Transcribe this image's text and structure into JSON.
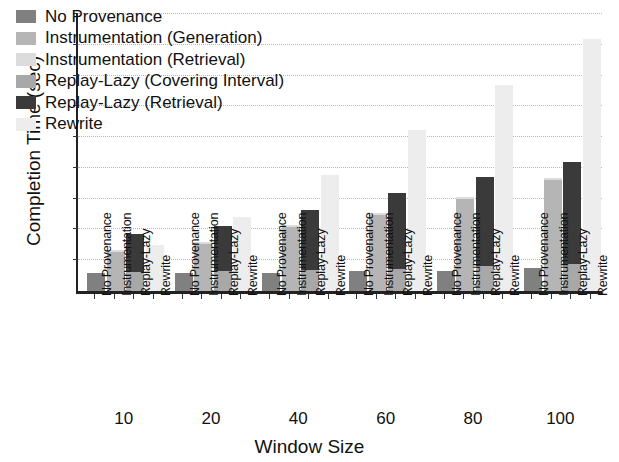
{
  "chart_data": {
    "type": "bar",
    "subtype": "grouped-stacked",
    "title": "",
    "xlabel": "Window Size",
    "ylabel": "Completion Time (sec)",
    "ylim": [
      0,
      45
    ],
    "ytick_labels": [
      "0",
      "5",
      "10",
      "15",
      "20",
      "25",
      "30",
      "35",
      "40",
      "45"
    ],
    "ytick_values": [
      0,
      5,
      10,
      15,
      20,
      25,
      30,
      35,
      40,
      45
    ],
    "grid": true,
    "legend_position": "upper-left-inside",
    "categories": [
      "10",
      "20",
      "40",
      "60",
      "80",
      "100"
    ],
    "bar_types": [
      "No Provenance",
      "Instrumentation",
      "Replay-Lazy",
      "Rewrite"
    ],
    "series": [
      {
        "name": "No Provenance",
        "color": "#808080",
        "bar_type": "No Provenance",
        "values": [
          3.0,
          3.0,
          3.0,
          3.2,
          3.2,
          3.8
        ]
      },
      {
        "name": "Instrumentation (Generation)",
        "color": "#b5b5b5",
        "bar_type": "Instrumentation",
        "values": [
          6.4,
          7.6,
          10.4,
          12.4,
          14.9,
          18.1
        ]
      },
      {
        "name": "Instrumentation (Retrieval)",
        "color": "#dcdcdc",
        "bar_type": "Instrumentation",
        "values": [
          0.3,
          0.3,
          0.3,
          0.3,
          0.3,
          0.3
        ]
      },
      {
        "name": "Replay-Lazy (Covering Interval)",
        "color": "#a8a8a8",
        "bar_type": "Replay-Lazy",
        "values": [
          3.1,
          3.3,
          3.4,
          3.5,
          4.0,
          4.4
        ]
      },
      {
        "name": "Replay-Lazy (Retrieval)",
        "color": "#3a3a3a",
        "bar_type": "Replay-Lazy",
        "values": [
          6.2,
          7.2,
          9.7,
          12.4,
          14.6,
          16.6
        ]
      },
      {
        "name": "Rewrite",
        "color": "#ededed",
        "bar_type": "Rewrite",
        "values": [
          7.4,
          12.0,
          18.9,
          26.2,
          33.4,
          41.0
        ]
      }
    ],
    "group_totals": {
      "No Provenance": [
        3.0,
        3.0,
        3.0,
        3.2,
        3.2,
        3.8
      ],
      "Instrumentation": [
        6.7,
        7.9,
        10.7,
        12.7,
        15.2,
        18.4
      ],
      "Replay-Lazy": [
        9.3,
        10.5,
        13.1,
        15.9,
        18.6,
        21.0
      ],
      "Rewrite": [
        7.4,
        12.0,
        18.9,
        26.2,
        33.4,
        41.0
      ]
    }
  },
  "legend": {
    "entries": [
      {
        "label": "No Provenance",
        "color": "#808080"
      },
      {
        "label": "Instrumentation (Generation)",
        "color": "#b5b5b5"
      },
      {
        "label": "Instrumentation (Retrieval)",
        "color": "#dcdcdc"
      },
      {
        "label": "Replay-Lazy (Covering Interval)",
        "color": "#a8a8a8"
      },
      {
        "label": "Replay-Lazy (Retrieval)",
        "color": "#3a3a3a"
      },
      {
        "label": "Rewrite",
        "color": "#ededed"
      }
    ]
  }
}
